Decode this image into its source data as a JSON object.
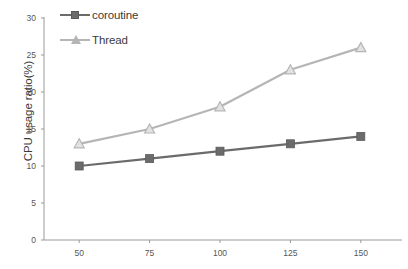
{
  "chart_data": {
    "type": "line",
    "title": "",
    "xlabel": "",
    "ylabel": "CPU usage ratio(%)",
    "x": [
      50,
      75,
      100,
      125,
      150
    ],
    "categories": [
      "50",
      "75",
      "100",
      "125",
      "150"
    ],
    "series": [
      {
        "name": "coroutine",
        "values": [
          10,
          11,
          12,
          13,
          14
        ],
        "color": "#6b6b6b",
        "marker": "square"
      },
      {
        "name": "Thread",
        "values": [
          13,
          15,
          18,
          23,
          26
        ],
        "color": "#b5b5b5",
        "marker": "triangle"
      }
    ],
    "ylim": [
      0,
      30
    ],
    "xlim": [
      37.5,
      162.5
    ],
    "yticks": [
      0,
      5,
      10,
      15,
      20,
      25,
      30
    ],
    "ytick_labels": [
      "0",
      "5",
      "10",
      "15",
      "20",
      "25",
      "30"
    ],
    "xticks": [
      50,
      75,
      100,
      125,
      150
    ],
    "xtick_labels": [
      "50",
      "75",
      "100",
      "125",
      "150"
    ],
    "grid": false,
    "legend_position": "top-left"
  },
  "legend": {
    "items": [
      {
        "label": "coroutine"
      },
      {
        "label": "Thread"
      }
    ]
  },
  "axes": {
    "y_axis_title": "CPU usage ratio(%)",
    "axis_color": "#9a9a9a"
  }
}
